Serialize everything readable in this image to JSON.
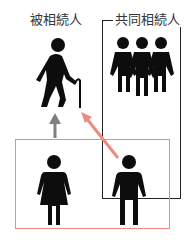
{
  "diagram": {
    "labels": {
      "decedent": "被相続人",
      "co_heirs": "共同相続人"
    },
    "nodes": [
      {
        "id": "decedent",
        "figure": "elderly-person-with-cane",
        "label": "被相続人"
      },
      {
        "id": "co-heir-group",
        "figure": "three-persons",
        "label": "共同相続人"
      },
      {
        "id": "female-heir",
        "figure": "woman"
      },
      {
        "id": "male-heir",
        "figure": "man"
      }
    ],
    "edges": [
      {
        "from": "female-heir",
        "to": "decedent",
        "color": "#808080",
        "style": "arrow"
      },
      {
        "from": "male-heir",
        "to": "decedent",
        "color": "#f08a80",
        "style": "arrow"
      }
    ],
    "groups": [
      {
        "name": "co-heirs-box",
        "color": "#222222",
        "members": [
          "co-heir-group",
          "male-heir"
        ]
      },
      {
        "name": "highlight-box",
        "color": "#f08a80",
        "members": [
          "female-heir",
          "male-heir"
        ]
      }
    ],
    "colors": {
      "figure": "#0d0d0d",
      "gray_arrow": "#808080",
      "red_accent": "#f08a80",
      "box_border": "#222222"
    }
  }
}
